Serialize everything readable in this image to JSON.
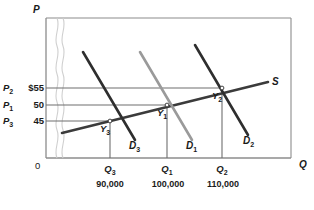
{
  "chart_data": {
    "type": "line",
    "title": "",
    "xlabel": "Q",
    "ylabel": "P",
    "grid": true,
    "legend": "inline-curve-labels",
    "axis_break": "wavy break on price axis near origin",
    "price_levels": [
      {
        "symbol": "P",
        "sub": "2",
        "value": "$55",
        "numeric": 55,
        "y_px": 88
      },
      {
        "symbol": "P",
        "sub": "1",
        "value": "50",
        "numeric": 50,
        "y_px": 105
      },
      {
        "symbol": "P",
        "sub": "3",
        "value": "45",
        "numeric": 45,
        "y_px": 121
      }
    ],
    "quantity_levels": [
      {
        "symbol": "Q",
        "sub": "3",
        "value": "90,000",
        "numeric": 90000,
        "x_px": 110
      },
      {
        "symbol": "Q",
        "sub": "1",
        "value": "100,000",
        "numeric": 100000,
        "x_px": 167
      },
      {
        "symbol": "Q",
        "sub": "2",
        "value": "110,000",
        "numeric": 110000,
        "x_px": 222
      }
    ],
    "series": [
      {
        "name": "S",
        "label": "S",
        "sub": "",
        "kind": "supply",
        "color": "#3b3b3b",
        "x1": 62,
        "y1": 133,
        "x2": 268,
        "y2": 82
      },
      {
        "name": "D3",
        "label": "D",
        "sub": "3",
        "kind": "demand",
        "color": "#2e2e2e",
        "x1": 83,
        "y1": 52,
        "x2": 135,
        "y2": 140
      },
      {
        "name": "D1",
        "label": "D",
        "sub": "1",
        "kind": "demand",
        "color": "#9a9a9a",
        "x1": 140,
        "y1": 52,
        "x2": 192,
        "y2": 140
      },
      {
        "name": "D2",
        "label": "D",
        "sub": "2",
        "kind": "demand",
        "color": "#2e2e2e",
        "x1": 195,
        "y1": 45,
        "x2": 248,
        "y2": 135
      }
    ],
    "equilibria": [
      {
        "name": "Y3",
        "label": "Y",
        "sub": "3",
        "x_px": 110,
        "y_px": 121,
        "price": 45,
        "quantity": 90000
      },
      {
        "name": "Y1",
        "label": "Y",
        "sub": "1",
        "x_px": 167,
        "y_px": 105,
        "price": 50,
        "quantity": 100000
      },
      {
        "name": "Y2",
        "label": "Y",
        "sub": "2",
        "x_px": 222,
        "y_px": 88,
        "price": 55,
        "quantity": 110000
      }
    ],
    "origin_label": "0"
  },
  "axes": {
    "price_axis_label": "P",
    "quantity_axis_label": "Q",
    "origin": "0"
  },
  "colors": {
    "frame": "#8c8c8c",
    "gridline": "#6e6e6e",
    "supply": "#3b3b3b",
    "demand_dark": "#2e2e2e",
    "demand_light": "#9a9a9a",
    "break": "#c8c8c8",
    "text": "#1a1a1a",
    "background": "#ffffff"
  }
}
